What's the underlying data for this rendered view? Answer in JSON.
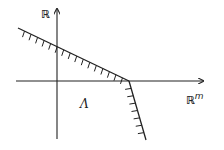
{
  "diagram": {
    "type": "cone-halfspace-sketch",
    "stroke_color": "#222222",
    "background": "#ffffff",
    "axes": {
      "vertical": {
        "label": "ℝ",
        "x": 57,
        "y_from": 139,
        "y_to": 8
      },
      "horizontal": {
        "label_base": "ℝ",
        "label_sup": "m",
        "y": 81,
        "x_from": 16,
        "x_to": 204
      }
    },
    "boundary_lines": [
      {
        "name": "shallow-boundary",
        "from": [
          18,
          28
        ],
        "to": [
          129,
          81
        ],
        "hatch_side": "below"
      },
      {
        "name": "steep-boundary",
        "from": [
          129,
          81
        ],
        "to": [
          146,
          140
        ],
        "hatch_side": "left"
      }
    ],
    "vertex": [
      129,
      81
    ],
    "region_label": "Λ"
  }
}
